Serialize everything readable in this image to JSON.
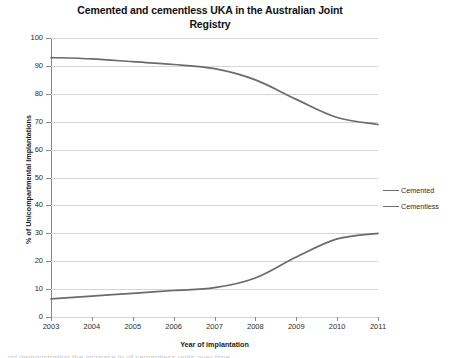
{
  "chart_data": {
    "type": "line",
    "title": "Cemented and cementless UKA in the Australian Joint Registry",
    "title_line1": "Cemented and cementless UKA in the Australian Joint",
    "title_line2": "Registry",
    "xlabel": "Year of implantation",
    "ylabel": "% of Unicompartmental Implantations",
    "categories": [
      "2003",
      "2004",
      "2005",
      "2006",
      "2007",
      "2008",
      "2009",
      "2010",
      "2011"
    ],
    "x": [
      2003,
      2004,
      2005,
      2006,
      2007,
      2008,
      2009,
      2010,
      2011
    ],
    "series": [
      {
        "name": "Cemented",
        "color": "#6b6b6b",
        "values": [
          93,
          92.5,
          91.5,
          90.5,
          89,
          85,
          78,
          71.5,
          69
        ]
      },
      {
        "name": "Cementless",
        "color": "#6b6b6b",
        "values": [
          6.5,
          7.5,
          8.5,
          9.5,
          10.5,
          14,
          21.5,
          28,
          30
        ]
      }
    ],
    "ylim": [
      0,
      100
    ],
    "ytick_step": 10,
    "yticks": [
      0,
      10,
      20,
      30,
      40,
      50,
      60,
      70,
      80,
      90,
      100
    ],
    "ytick_labels": [
      "0",
      "10",
      "20",
      "30",
      "40",
      "50",
      "60",
      "70",
      "80",
      "90",
      "100"
    ],
    "xlim": [
      2003,
      2011
    ],
    "grid": "horizontal",
    "legend_position": "right",
    "legend": [
      "Cemented",
      "Cementless"
    ],
    "gridline_color": "#d4d4d4",
    "axis_color": "#8a8a8a",
    "background": "#ffffff"
  },
  "footer": {
    "cutoff_text": "nd demonstrating the increase in of cementless units over time"
  }
}
